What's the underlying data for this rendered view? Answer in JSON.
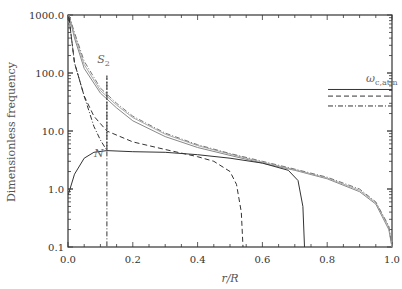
{
  "chart_data": {
    "type": "line",
    "title": "",
    "xlabel": "r/R",
    "ylabel": "Dimensionless frequency",
    "xlim": [
      0.0,
      1.0
    ],
    "ylim": [
      0.1,
      1000.0
    ],
    "yscale": "log",
    "grid": false,
    "x_ticks": [
      "0.0",
      "0.2",
      "0.4",
      "0.6",
      "0.8",
      "1.0"
    ],
    "y_ticks": [
      "0.1",
      "1.0",
      "10.0",
      "100.0",
      "1000.0"
    ],
    "annotations": [
      {
        "text": "S",
        "subscript": "2",
        "x": 0.09,
        "y": 150
      },
      {
        "text": "N",
        "x": 0.08,
        "y": 3.5
      },
      {
        "text": "ω",
        "subscript": "c,atm",
        "x": 0.92,
        "y": 70
      }
    ],
    "legend_lines": [
      {
        "style": "solid",
        "y": 52
      },
      {
        "style": "dashed",
        "y": 40
      },
      {
        "style": "dash-dot",
        "y": 27
      }
    ],
    "series": [
      {
        "name": "S2 (solid)",
        "style": "solid",
        "color": "#888888",
        "x": [
          0.003,
          0.02,
          0.05,
          0.1,
          0.15,
          0.2,
          0.3,
          0.4,
          0.5,
          0.6,
          0.7,
          0.8,
          0.9,
          0.95,
          0.99,
          1.0
        ],
        "y": [
          1000,
          400,
          120,
          45,
          25,
          15,
          8,
          5.2,
          3.8,
          2.8,
          2.1,
          1.5,
          0.9,
          0.55,
          0.2,
          0.1
        ]
      },
      {
        "name": "S2 (dashed)",
        "style": "solid",
        "color": "#aaaaaa",
        "x": [
          0.003,
          0.02,
          0.05,
          0.1,
          0.15,
          0.2,
          0.3,
          0.4,
          0.5,
          0.6,
          0.7,
          0.8,
          0.9,
          0.95,
          0.99,
          1.0
        ],
        "y": [
          1000,
          450,
          140,
          50,
          28,
          17,
          8.8,
          5.6,
          4.0,
          2.9,
          2.15,
          1.55,
          0.95,
          0.58,
          0.22,
          0.1
        ]
      },
      {
        "name": "S2 (dash-dot)",
        "style": "dash-dot",
        "color": "#777777",
        "x": [
          0.003,
          0.02,
          0.05,
          0.1,
          0.15,
          0.2,
          0.3,
          0.4,
          0.5,
          0.6,
          0.7,
          0.8,
          0.9,
          0.95,
          0.99,
          1.0
        ],
        "y": [
          1000,
          500,
          160,
          55,
          30,
          18,
          9.2,
          5.8,
          4.1,
          3.0,
          2.2,
          1.6,
          1.0,
          0.6,
          0.23,
          0.1
        ]
      },
      {
        "name": "N (solid)",
        "style": "solid",
        "color": "#333333",
        "x": [
          0.001,
          0.02,
          0.05,
          0.08,
          0.12,
          0.2,
          0.3,
          0.4,
          0.5,
          0.6,
          0.68,
          0.71,
          0.725,
          0.73
        ],
        "y": [
          0.8,
          1.8,
          3.4,
          4.3,
          4.6,
          4.4,
          4.3,
          3.9,
          3.4,
          2.8,
          2.1,
          1.4,
          0.5,
          0.1
        ]
      },
      {
        "name": "N (dashed)",
        "style": "dashed",
        "color": "#333333",
        "x": [
          0.003,
          0.02,
          0.05,
          0.08,
          0.12,
          0.2,
          0.3,
          0.4,
          0.45,
          0.5,
          0.52,
          0.535,
          0.54
        ],
        "y": [
          900,
          150,
          40,
          18,
          10,
          6.5,
          4.8,
          3.6,
          3.0,
          2.0,
          1.2,
          0.4,
          0.1
        ]
      },
      {
        "name": "N (dash-dot)",
        "style": "dash-dot",
        "color": "#333333",
        "x": [
          0.003,
          0.02,
          0.05,
          0.08,
          0.1,
          0.12,
          0.12,
          0.12
        ],
        "y": [
          900,
          150,
          40,
          12,
          7,
          4.6,
          90,
          0.1
        ]
      }
    ]
  }
}
